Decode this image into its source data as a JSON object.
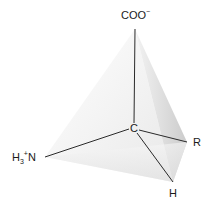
{
  "diagram": {
    "center_atom": "C",
    "groups": {
      "top": {
        "text": "COO",
        "charge": "−"
      },
      "left": {
        "prefix": "H",
        "subscript": "3",
        "charge": "+",
        "atom": "N"
      },
      "right": {
        "text": "R"
      },
      "bottom": {
        "text": "H"
      }
    },
    "vertices": {
      "apex": [
        135,
        29
      ],
      "center": [
        134,
        128
      ],
      "left": [
        45,
        157
      ],
      "right": [
        187,
        142
      ],
      "bottom": [
        173,
        182
      ]
    },
    "colors": {
      "bond": "#2a2a2a",
      "face_light": "#f3f3f3",
      "face_mid": "#e4e4e4",
      "face_dark": "#cfcfcf",
      "text": "#1a1a1a"
    }
  }
}
